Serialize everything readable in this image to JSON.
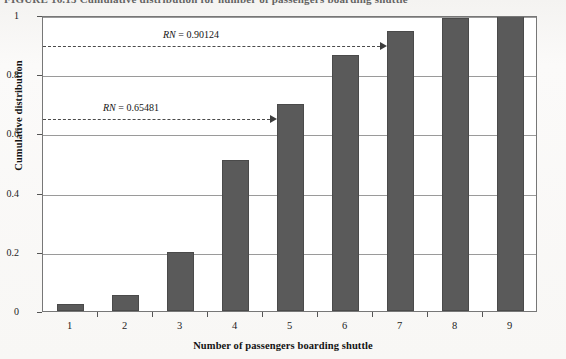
{
  "figure": {
    "caption": "FIGURE 16.15    Cumulative distribution for number of passengers boarding shuttle"
  },
  "chart_data": {
    "type": "bar",
    "title": "",
    "xlabel": "Number of passengers boarding shuttle",
    "ylabel": "Cumulative distribution",
    "categories": [
      "1",
      "2",
      "3",
      "4",
      "5",
      "6",
      "7",
      "8",
      "9"
    ],
    "values": [
      0.025,
      0.055,
      0.2,
      0.51,
      0.7,
      0.865,
      0.945,
      0.99,
      1.0
    ],
    "xlim": [
      0.5,
      9.5
    ],
    "ylim": [
      0,
      1
    ],
    "yticks": [
      "0",
      "0.2",
      "0.4",
      "0.6",
      "0.8",
      "1"
    ],
    "ytick_values": [
      0,
      0.2,
      0.4,
      0.6,
      0.8,
      1
    ],
    "grid": true,
    "legend": "none",
    "bar_color": "#5a5a5a",
    "plot_background": "#ffffff",
    "annotations": [
      {
        "label_prefix": "RN",
        "label_equals": " = ",
        "label_value": "0.90124",
        "full_label": "RN = 0.90124",
        "y_value": 0.90124,
        "points_to_category": "7",
        "style": "dashed-arrow"
      },
      {
        "label_prefix": "RN",
        "label_equals": " = ",
        "label_value": "0.65481",
        "full_label": "RN = 0.65481",
        "y_value": 0.65481,
        "points_to_category": "5",
        "style": "dashed-arrow"
      }
    ]
  }
}
